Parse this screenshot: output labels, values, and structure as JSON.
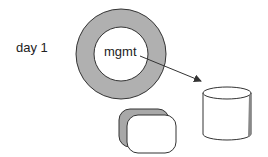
{
  "diagram": {
    "day_label": "day 1",
    "ring_label": "mgmt",
    "colors": {
      "ring_fill": "#b0b0b0",
      "stroke": "#333333",
      "shadow_fill": "#a8a8a8",
      "background": "#ffffff"
    },
    "shapes": [
      {
        "type": "ring",
        "name": "management-ring"
      },
      {
        "type": "arrow",
        "name": "ring-to-cylinder-arrow"
      },
      {
        "type": "cylinder",
        "name": "storage-cylinder"
      },
      {
        "type": "rounded-box",
        "name": "rounded-box-3d"
      }
    ]
  }
}
